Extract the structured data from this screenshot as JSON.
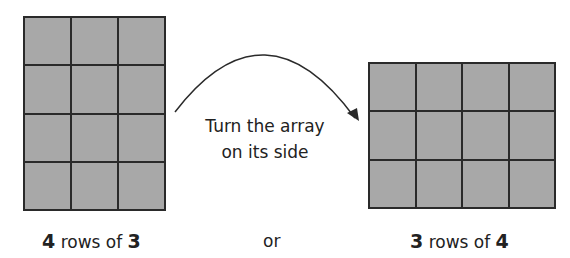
{
  "left_array": {
    "rows": 4,
    "cols": 3,
    "caption_num1": "4",
    "caption_mid": " rows of ",
    "caption_num2": "3"
  },
  "right_array": {
    "rows": 3,
    "cols": 4,
    "caption_num1": "3",
    "caption_mid": " rows of ",
    "caption_num2": "4"
  },
  "arrow_caption": {
    "line1": "Turn the array",
    "line2": "on its side"
  },
  "connector": "or",
  "colors": {
    "cell_fill": "#a8a8a8",
    "grid_line": "#2a2a2a"
  }
}
